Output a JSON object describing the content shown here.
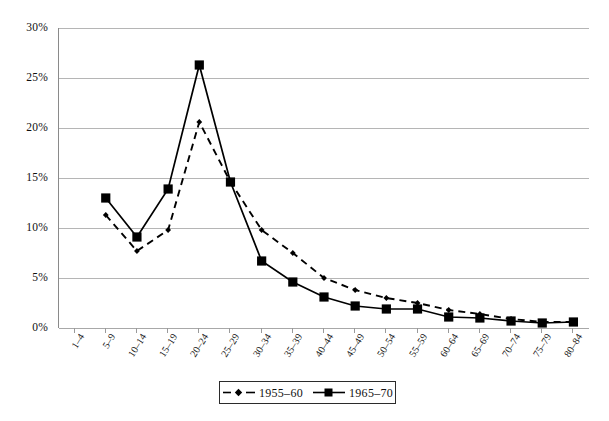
{
  "chart_data": {
    "type": "line",
    "title": "",
    "xlabel": "",
    "ylabel": "",
    "categories": [
      "1–4",
      "5–9",
      "10–14",
      "15–19",
      "20–24",
      "25–29",
      "30–34",
      "35–39",
      "40–44",
      "45–49",
      "50–54",
      "55–59",
      "60–64",
      "65–69",
      "70–74",
      "75–79",
      "80–84"
    ],
    "ylim": [
      0,
      30
    ],
    "ytick_labels": [
      "0%",
      "5%",
      "10%",
      "15%",
      "20%",
      "25%",
      "30%"
    ],
    "ytick_values": [
      0,
      5,
      10,
      15,
      20,
      25,
      30
    ],
    "grid": true,
    "legend_position": "bottom-center",
    "series": [
      {
        "name": "1955–60",
        "style": "dashed",
        "marker": "small-diamond",
        "color": "#000000",
        "values": [
          null,
          11.3,
          7.7,
          9.8,
          20.6,
          14.6,
          9.8,
          7.5,
          5.0,
          3.8,
          3.0,
          2.5,
          1.8,
          1.4,
          0.9,
          0.6,
          0.6
        ]
      },
      {
        "name": "1965–70",
        "style": "solid",
        "marker": "square",
        "color": "#000000",
        "values": [
          null,
          13.0,
          9.1,
          13.9,
          26.3,
          14.6,
          6.7,
          4.6,
          3.1,
          2.2,
          1.9,
          1.9,
          1.1,
          1.0,
          0.7,
          0.5,
          0.6
        ]
      }
    ]
  },
  "legend": {
    "items": [
      {
        "label": "1955–60"
      },
      {
        "label": "1965–70"
      }
    ]
  }
}
